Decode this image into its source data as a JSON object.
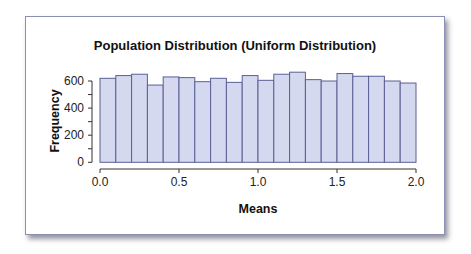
{
  "chart_data": {
    "type": "bar",
    "title": "Population Distribution (Uniform Distribution)",
    "xlabel": "Means",
    "ylabel": "Frequency",
    "bin_edges": [
      0.0,
      0.1,
      0.2,
      0.3,
      0.4,
      0.5,
      0.6,
      0.7,
      0.8,
      0.9,
      1.0,
      1.1,
      1.2,
      1.3,
      1.4,
      1.5,
      1.6,
      1.7,
      1.8,
      1.9,
      2.0
    ],
    "categories": [
      "0.0-0.1",
      "0.1-0.2",
      "0.2-0.3",
      "0.3-0.4",
      "0.4-0.5",
      "0.5-0.6",
      "0.6-0.7",
      "0.7-0.8",
      "0.8-0.9",
      "0.9-1.0",
      "1.0-1.1",
      "1.1-1.2",
      "1.2-1.3",
      "1.3-1.4",
      "1.4-1.5",
      "1.5-1.6",
      "1.6-1.7",
      "1.7-1.8",
      "1.8-1.9",
      "1.9-2.0"
    ],
    "values": [
      620,
      640,
      650,
      570,
      630,
      625,
      595,
      620,
      590,
      640,
      605,
      650,
      665,
      610,
      600,
      655,
      635,
      635,
      600,
      585
    ],
    "xlim": [
      0.0,
      2.0
    ],
    "ylim": [
      0,
      600
    ],
    "xticks": [
      "0.0",
      "0.5",
      "1.0",
      "1.5",
      "2.0"
    ],
    "yticks": [
      "0",
      "200",
      "400",
      "600"
    ],
    "grid": false,
    "legend": null,
    "colors": {
      "bar_fill": "#d5d9ef",
      "bar_edge": "#5a5f96",
      "axis": "#333333"
    }
  }
}
